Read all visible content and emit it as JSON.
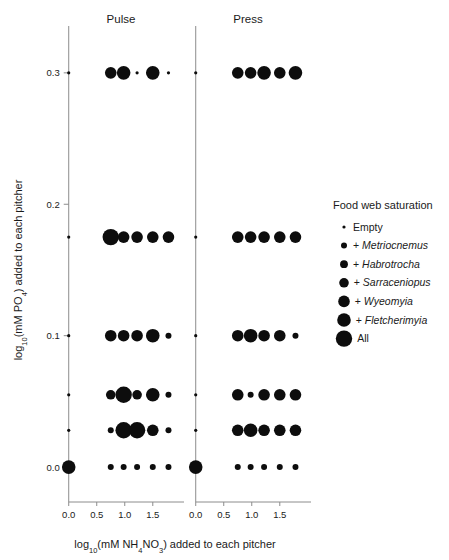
{
  "figure": {
    "panels": [
      {
        "id": "pulse",
        "title": "Pulse"
      },
      {
        "id": "press",
        "title": "Press"
      }
    ],
    "axes": {
      "x_title_parts": {
        "pre": "log",
        "sub1": "10",
        "mid": "(mM NH",
        "sub2": "4",
        "mid2": "NO",
        "sub3": "3",
        "post": ") added to each pitcher"
      },
      "x_title_plain": "log10(mM NH4NO3) added to each pitcher",
      "y_title_parts": {
        "pre": "log",
        "sub1": "10",
        "mid": "(mM PO",
        "sub2": "4",
        "post": ") added to each pitcher"
      },
      "y_title_plain": "log10(mM PO4) added to each pitcher",
      "x_ticks": [
        "0.0",
        "0.5",
        "1.0",
        "1.5"
      ],
      "y_ticks": [
        "0.0",
        "0.1",
        "0.2",
        "0.3"
      ]
    },
    "legend": {
      "title": "Food web saturation",
      "items": [
        {
          "label": "Empty",
          "prefix": "",
          "italic": "",
          "size": 1
        },
        {
          "label": "+ Metriocnemus",
          "prefix": "+ ",
          "italic": "Metriocnemus",
          "size": 2
        },
        {
          "label": "+ Habrotrocha",
          "prefix": "+ ",
          "italic": "Habrotrocha",
          "size": 3
        },
        {
          "label": "+ Sarraceniopus",
          "prefix": "+ ",
          "italic": "Sarraceniopus",
          "size": 4
        },
        {
          "label": "+ Wyeomyia",
          "prefix": "+ ",
          "italic": "Wyeomyia",
          "size": 5
        },
        {
          "label": "+ Fletcherimyia",
          "prefix": "+ ",
          "italic": "Fletcherimyia",
          "size": 6
        },
        {
          "label": "All",
          "prefix": "",
          "italic": "",
          "size": 7
        }
      ]
    }
  },
  "chart_data": {
    "type": "scatter",
    "title": "",
    "xlabel": "log10(mM NH4NO3) added to each pitcher",
    "ylabel": "log10(mM PO4) added to each pitcher",
    "xlim": [
      -0.12,
      1.95
    ],
    "ylim": [
      -0.022,
      0.325
    ],
    "grid": false,
    "legend_position": "right",
    "size_legend": {
      "name": "Food web saturation",
      "levels": [
        "Empty",
        "+ Metriocnemus",
        "+ Habrotrocha",
        "+ Sarraceniopus",
        "+ Wyeomyia",
        "+ Fletcherimyia",
        "All"
      ],
      "radii_px": [
        1.6,
        3.0,
        3.9,
        4.8,
        5.8,
        6.8,
        8.2
      ]
    },
    "series": [
      {
        "name": "Pulse",
        "points": [
          {
            "x": 0.0,
            "y": 0.3,
            "size": 1
          },
          {
            "x": 0.75,
            "y": 0.3,
            "size": 5
          },
          {
            "x": 0.98,
            "y": 0.3,
            "size": 6
          },
          {
            "x": 1.22,
            "y": 0.3,
            "size": 1
          },
          {
            "x": 1.5,
            "y": 0.3,
            "size": 6
          },
          {
            "x": 1.78,
            "y": 0.3,
            "size": 1
          },
          {
            "x": 0.0,
            "y": 0.175,
            "size": 1
          },
          {
            "x": 0.75,
            "y": 0.175,
            "size": 7
          },
          {
            "x": 0.98,
            "y": 0.175,
            "size": 5
          },
          {
            "x": 1.22,
            "y": 0.175,
            "size": 5
          },
          {
            "x": 1.5,
            "y": 0.175,
            "size": 5
          },
          {
            "x": 1.78,
            "y": 0.175,
            "size": 5
          },
          {
            "x": 0.0,
            "y": 0.1,
            "size": 1
          },
          {
            "x": 0.75,
            "y": 0.1,
            "size": 5
          },
          {
            "x": 0.98,
            "y": 0.1,
            "size": 5
          },
          {
            "x": 1.22,
            "y": 0.1,
            "size": 5
          },
          {
            "x": 1.5,
            "y": 0.1,
            "size": 6
          },
          {
            "x": 1.78,
            "y": 0.1,
            "size": 2
          },
          {
            "x": 0.0,
            "y": 0.055,
            "size": 1
          },
          {
            "x": 0.75,
            "y": 0.055,
            "size": 4
          },
          {
            "x": 0.98,
            "y": 0.055,
            "size": 7
          },
          {
            "x": 1.22,
            "y": 0.055,
            "size": 4
          },
          {
            "x": 1.5,
            "y": 0.055,
            "size": 6
          },
          {
            "x": 1.78,
            "y": 0.055,
            "size": 2
          },
          {
            "x": 0.0,
            "y": 0.028,
            "size": 1
          },
          {
            "x": 0.75,
            "y": 0.028,
            "size": 2
          },
          {
            "x": 0.98,
            "y": 0.028,
            "size": 7
          },
          {
            "x": 1.22,
            "y": 0.028,
            "size": 7
          },
          {
            "x": 1.5,
            "y": 0.028,
            "size": 5
          },
          {
            "x": 1.78,
            "y": 0.028,
            "size": 2
          },
          {
            "x": 0.0,
            "y": 0.0,
            "size": 6
          },
          {
            "x": 0.75,
            "y": 0.0,
            "size": 2
          },
          {
            "x": 0.98,
            "y": 0.0,
            "size": 2
          },
          {
            "x": 1.22,
            "y": 0.0,
            "size": 2
          },
          {
            "x": 1.5,
            "y": 0.0,
            "size": 2
          },
          {
            "x": 1.78,
            "y": 0.0,
            "size": 2
          }
        ]
      },
      {
        "name": "Press",
        "points": [
          {
            "x": 0.0,
            "y": 0.3,
            "size": 1
          },
          {
            "x": 0.75,
            "y": 0.3,
            "size": 5
          },
          {
            "x": 0.98,
            "y": 0.3,
            "size": 5
          },
          {
            "x": 1.22,
            "y": 0.3,
            "size": 6
          },
          {
            "x": 1.5,
            "y": 0.3,
            "size": 5
          },
          {
            "x": 1.78,
            "y": 0.3,
            "size": 6
          },
          {
            "x": 0.0,
            "y": 0.175,
            "size": 1
          },
          {
            "x": 0.75,
            "y": 0.175,
            "size": 5
          },
          {
            "x": 0.98,
            "y": 0.175,
            "size": 5
          },
          {
            "x": 1.22,
            "y": 0.175,
            "size": 5
          },
          {
            "x": 1.5,
            "y": 0.175,
            "size": 5
          },
          {
            "x": 1.78,
            "y": 0.175,
            "size": 5
          },
          {
            "x": 0.0,
            "y": 0.1,
            "size": 1
          },
          {
            "x": 0.75,
            "y": 0.1,
            "size": 5
          },
          {
            "x": 0.98,
            "y": 0.1,
            "size": 6
          },
          {
            "x": 1.22,
            "y": 0.1,
            "size": 5
          },
          {
            "x": 1.5,
            "y": 0.1,
            "size": 5
          },
          {
            "x": 1.78,
            "y": 0.1,
            "size": 2
          },
          {
            "x": 0.0,
            "y": 0.055,
            "size": 1
          },
          {
            "x": 0.75,
            "y": 0.055,
            "size": 5
          },
          {
            "x": 0.98,
            "y": 0.055,
            "size": 2
          },
          {
            "x": 1.22,
            "y": 0.055,
            "size": 5
          },
          {
            "x": 1.5,
            "y": 0.055,
            "size": 5
          },
          {
            "x": 1.78,
            "y": 0.055,
            "size": 5
          },
          {
            "x": 0.0,
            "y": 0.028,
            "size": 1
          },
          {
            "x": 0.75,
            "y": 0.028,
            "size": 5
          },
          {
            "x": 0.98,
            "y": 0.028,
            "size": 6
          },
          {
            "x": 1.22,
            "y": 0.028,
            "size": 5
          },
          {
            "x": 1.5,
            "y": 0.028,
            "size": 5
          },
          {
            "x": 1.78,
            "y": 0.028,
            "size": 5
          },
          {
            "x": 0.0,
            "y": 0.0,
            "size": 6
          },
          {
            "x": 0.75,
            "y": 0.0,
            "size": 2
          },
          {
            "x": 0.98,
            "y": 0.0,
            "size": 2
          },
          {
            "x": 1.22,
            "y": 0.0,
            "size": 2
          },
          {
            "x": 1.5,
            "y": 0.0,
            "size": 2
          },
          {
            "x": 1.78,
            "y": 0.0,
            "size": 2
          }
        ]
      }
    ]
  }
}
